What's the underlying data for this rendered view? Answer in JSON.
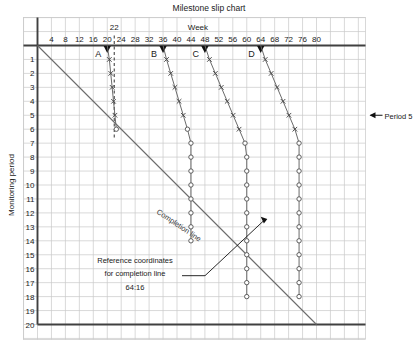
{
  "title": "Milestone slip chart",
  "axes": {
    "x_label": "Week",
    "y_label": "Monitoring period",
    "x_ticks": [
      "4",
      "8",
      "12",
      "16",
      "20",
      "24",
      "28",
      "32",
      "36",
      "40",
      "44",
      "48",
      "52",
      "56",
      "60",
      "64",
      "68",
      "72",
      "76",
      "80"
    ],
    "y_ticks": [
      "1",
      "2",
      "3",
      "4",
      "5",
      "6",
      "7",
      "8",
      "9",
      "10",
      "11",
      "12",
      "13",
      "14",
      "15",
      "16",
      "17",
      "18",
      "19",
      "20"
    ],
    "x_range": [
      0,
      84
    ],
    "y_range": [
      0,
      20
    ],
    "grid": true
  },
  "annotations": {
    "current_week": "22",
    "period_marker": "Period 5",
    "completion_line_label": "Completion line",
    "reference_line1": "Reference coordinates",
    "reference_line2": "for completion line",
    "reference_line3": "64:16"
  },
  "colors": {
    "grid": "#c8c8c8",
    "axis": "#404040",
    "plot": "#6b6b6b",
    "text": "#1a1a1a"
  },
  "chart_data": {
    "type": "line",
    "title": "Milestone slip chart",
    "xlabel": "Week",
    "ylabel": "Monitoring period",
    "xlim": [
      0,
      84
    ],
    "ylim": [
      0,
      20
    ],
    "grid": true,
    "legend": "none",
    "completion_line": {
      "label": "Completion line",
      "from": {
        "week": 0,
        "period": 0
      },
      "to": {
        "week": 80,
        "period": 20
      },
      "reference": "64:16"
    },
    "current_week_marker": 22,
    "period_marker": 5,
    "series": [
      {
        "name": "A",
        "planned_week": 20,
        "marker_style": "cross-then-circle",
        "points": [
          {
            "period": 1,
            "week": 20.6,
            "marker": "x"
          },
          {
            "period": 2,
            "week": 21.0,
            "marker": "x"
          },
          {
            "period": 3,
            "week": 21.4,
            "marker": "x"
          },
          {
            "period": 4,
            "week": 21.8,
            "marker": "x"
          },
          {
            "period": 5,
            "week": 22.2,
            "marker": "x"
          },
          {
            "period": 6,
            "week": 22.6,
            "marker": "o"
          }
        ]
      },
      {
        "name": "B",
        "planned_week": 36,
        "marker_style": "cross-then-circle",
        "points": [
          {
            "period": 1,
            "week": 37.0,
            "marker": "x"
          },
          {
            "period": 2,
            "week": 38.2,
            "marker": "x"
          },
          {
            "period": 3,
            "week": 39.4,
            "marker": "x"
          },
          {
            "period": 4,
            "week": 40.6,
            "marker": "x"
          },
          {
            "period": 5,
            "week": 41.8,
            "marker": "x"
          },
          {
            "period": 6,
            "week": 43.0,
            "marker": "o"
          },
          {
            "period": 7,
            "week": 44.0,
            "marker": "o"
          },
          {
            "period": 8,
            "week": 44.0,
            "marker": "o"
          },
          {
            "period": 9,
            "week": 44.0,
            "marker": "o"
          },
          {
            "period": 10,
            "week": 44.0,
            "marker": "o"
          },
          {
            "period": 11,
            "week": 44.0,
            "marker": "o"
          },
          {
            "period": 12,
            "week": 44.0,
            "marker": "o"
          },
          {
            "period": 13,
            "week": 44.0,
            "marker": "o"
          },
          {
            "period": 14,
            "week": 44.0,
            "marker": "o"
          }
        ]
      },
      {
        "name": "C",
        "planned_week": 48,
        "marker_style": "cross-then-circle",
        "points": [
          {
            "period": 1,
            "week": 49.3,
            "marker": "x"
          },
          {
            "period": 2,
            "week": 51.0,
            "marker": "x"
          },
          {
            "period": 3,
            "week": 52.7,
            "marker": "x"
          },
          {
            "period": 4,
            "week": 54.4,
            "marker": "x"
          },
          {
            "period": 5,
            "week": 56.1,
            "marker": "x"
          },
          {
            "period": 6,
            "week": 57.8,
            "marker": "x"
          },
          {
            "period": 7,
            "week": 59.5,
            "marker": "o"
          },
          {
            "period": 8,
            "week": 60.0,
            "marker": "o"
          },
          {
            "period": 9,
            "week": 60.0,
            "marker": "o"
          },
          {
            "period": 10,
            "week": 60.0,
            "marker": "o"
          },
          {
            "period": 11,
            "week": 60.0,
            "marker": "o"
          },
          {
            "period": 12,
            "week": 60.0,
            "marker": "o"
          },
          {
            "period": 13,
            "week": 60.0,
            "marker": "o"
          },
          {
            "period": 14,
            "week": 60.0,
            "marker": "o"
          },
          {
            "period": 15,
            "week": 60.0,
            "marker": "o"
          },
          {
            "period": 16,
            "week": 60.0,
            "marker": "o"
          },
          {
            "period": 17,
            "week": 60.0,
            "marker": "o"
          },
          {
            "period": 18,
            "week": 60.0,
            "marker": "o"
          }
        ]
      },
      {
        "name": "D",
        "planned_week": 64,
        "marker_style": "cross-then-circle",
        "points": [
          {
            "period": 1,
            "week": 65.3,
            "marker": "x"
          },
          {
            "period": 2,
            "week": 67.0,
            "marker": "x"
          },
          {
            "period": 3,
            "week": 68.7,
            "marker": "x"
          },
          {
            "period": 4,
            "week": 70.4,
            "marker": "x"
          },
          {
            "period": 5,
            "week": 72.1,
            "marker": "x"
          },
          {
            "period": 6,
            "week": 73.8,
            "marker": "x"
          },
          {
            "period": 7,
            "week": 75.0,
            "marker": "o"
          },
          {
            "period": 8,
            "week": 75.0,
            "marker": "o"
          },
          {
            "period": 9,
            "week": 75.0,
            "marker": "o"
          },
          {
            "period": 10,
            "week": 75.0,
            "marker": "o"
          },
          {
            "period": 11,
            "week": 75.0,
            "marker": "o"
          },
          {
            "period": 12,
            "week": 75.0,
            "marker": "o"
          },
          {
            "period": 13,
            "week": 75.0,
            "marker": "o"
          },
          {
            "period": 14,
            "week": 75.0,
            "marker": "o"
          },
          {
            "period": 15,
            "week": 75.0,
            "marker": "o"
          },
          {
            "period": 16,
            "week": 75.0,
            "marker": "o"
          },
          {
            "period": 17,
            "week": 75.0,
            "marker": "o"
          },
          {
            "period": 18,
            "week": 75.0,
            "marker": "o"
          }
        ]
      }
    ]
  }
}
